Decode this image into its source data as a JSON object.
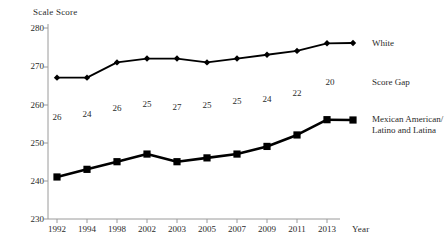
{
  "chart_data": {
    "type": "line",
    "title": "",
    "ylabel": "Scale Score",
    "xlabel": "Year",
    "categories": [
      "1992",
      "1994",
      "1998",
      "2002",
      "2003",
      "2005",
      "2007",
      "2009",
      "2011",
      "2013"
    ],
    "ylim": [
      230,
      280
    ],
    "yticks": [
      "230",
      "240",
      "250",
      "260",
      "270",
      "280"
    ],
    "grid": false,
    "legend_position": "right",
    "series": [
      {
        "name": "White",
        "marker": "diamond",
        "color": "#000000",
        "values": [
          267,
          267,
          271,
          272,
          272,
          271,
          272,
          273,
          274,
          276
        ]
      },
      {
        "name": "Mexican American/\nLatino and Latina",
        "marker": "square",
        "color": "#000000",
        "values": [
          241,
          243,
          245,
          247,
          245,
          246,
          247,
          249,
          252,
          256
        ]
      }
    ],
    "annotations": {
      "name": "Score Gap",
      "values": [
        26,
        24,
        26,
        25,
        27,
        25,
        25,
        24,
        22,
        20
      ]
    }
  },
  "legend": {
    "white_label": "White",
    "gap_label": "Score Gap",
    "gap_value": "20",
    "hispanic_label_line1": "Mexican American/",
    "hispanic_label_line2": "Latino and Latina"
  }
}
